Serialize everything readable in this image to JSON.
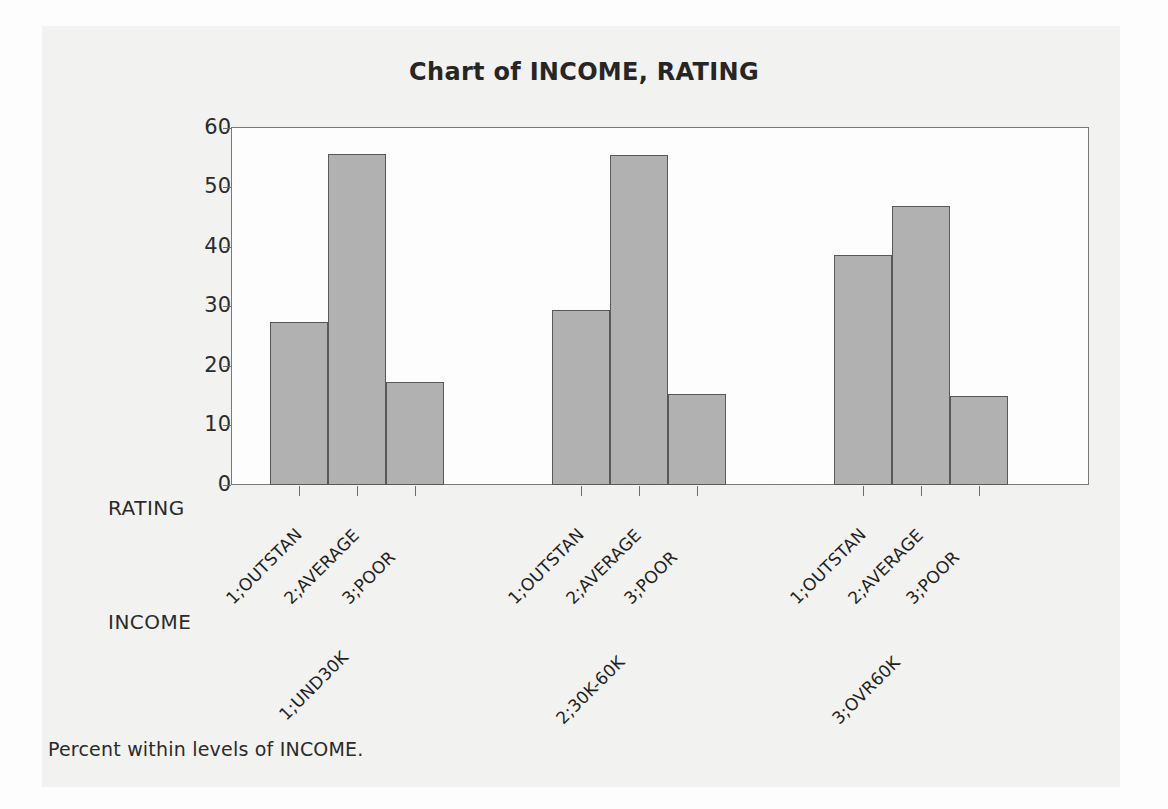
{
  "chart_data": {
    "type": "bar",
    "title": "Chart of INCOME, RATING",
    "xlabel": "RATING",
    "ylabel": "Percent",
    "ylim": [
      0,
      60
    ],
    "yticks": [
      0,
      10,
      20,
      30,
      40,
      50,
      60
    ],
    "grid": false,
    "legend": "none",
    "group_axis_label": "INCOME",
    "groups": [
      "1;UND30K",
      "2;30K-60K",
      "3;OVR60K"
    ],
    "categories": [
      "1;OUTSTAN",
      "2;AVERAGE",
      "3;POOR"
    ],
    "series": [
      {
        "name": "1;UND30K",
        "values": [
          27.4,
          55.5,
          17.2
        ]
      },
      {
        "name": "2;30K-60K",
        "values": [
          29.4,
          55.3,
          15.3
        ]
      },
      {
        "name": "3;OVR60K",
        "values": [
          38.6,
          46.8,
          15.0
        ]
      }
    ],
    "footnote": "Percent within levels of INCOME.",
    "bar_fill_color": "#b3b3b3",
    "bar_edge_color": "#595959",
    "plot_background": "#ffffff",
    "page_background": "#f2f2f0"
  },
  "axes": {
    "y_label": "Percent",
    "y_tick_labels": [
      "60",
      "50",
      "40",
      "30",
      "20",
      "10",
      "0"
    ],
    "x_axis_name": "RATING",
    "group_axis_name": "INCOME"
  },
  "footnote": {
    "text": "Percent within levels of INCOME."
  },
  "title": {
    "text": "Chart of INCOME, RATING"
  },
  "tick_labels": {
    "rating": [
      "1;OUTSTAN",
      "2;AVERAGE",
      "3;POOR",
      "1;OUTSTAN",
      "2;AVERAGE",
      "3;POOR",
      "1;OUTSTAN",
      "2;AVERAGE",
      "3;POOR"
    ],
    "income": [
      "1;UND30K",
      "2;30K-60K",
      "3;OVR60K"
    ]
  }
}
